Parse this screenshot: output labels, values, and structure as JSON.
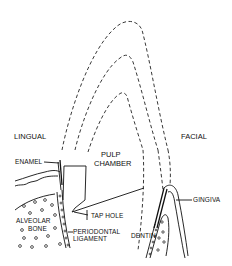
{
  "diagram": {
    "labels": {
      "lingual": "LINGUAL",
      "facial": "FACIAL",
      "enamel": "ENAMEL",
      "pulp_line1": "PULP",
      "pulp_line2": "CHAMBER",
      "alveolar_line1": "ALVEOLAR",
      "alveolar_line2": "BONE",
      "tap_hole": "TAP HOLE",
      "periodontal_line1": "PERIODONTAL",
      "periodontal_line2": "LIGAMENT",
      "gingiva": "GINGIVA",
      "dentin": "DENTIN"
    },
    "colors": {
      "line": "#111111",
      "background": "#ffffff"
    }
  }
}
